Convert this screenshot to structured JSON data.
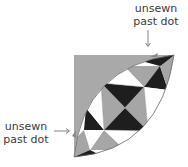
{
  "diagram": {
    "type": "quilt-block-piecing-diagram",
    "labels": {
      "top": {
        "line1": "unsewn",
        "line2": "past dot"
      },
      "left": {
        "line1": "unsewn",
        "line2": "past dot"
      }
    },
    "colors": {
      "background": "#ffffff",
      "dark": "#1e1e1e",
      "medium": "#a6a6a6",
      "light": "#ffffff",
      "corner_fabric": "#a9a9a9",
      "outline": "#6a6a6a",
      "text": "#3a3a3a"
    }
  }
}
